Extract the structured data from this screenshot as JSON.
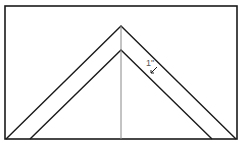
{
  "diagram": {
    "type": "geometric-figure",
    "colors": {
      "stroke": "#1a1a1a",
      "center_line": "#888888",
      "label": "#555555",
      "background": "#ffffff"
    },
    "frame": {
      "x": 5,
      "y": 6,
      "width": 232,
      "height": 133
    },
    "outer_triangle": {
      "apex": [
        121,
        26
      ],
      "left_base": [
        6,
        139
      ],
      "right_base": [
        236,
        139
      ]
    },
    "inner_triangle": {
      "apex": [
        121,
        50
      ],
      "left_base": [
        30,
        139
      ],
      "right_base": [
        212,
        139
      ]
    },
    "center_line": {
      "x": 121,
      "y1": 26,
      "y2": 139
    },
    "dimension": {
      "label": "1\"",
      "x": 146,
      "y": 66
    }
  }
}
